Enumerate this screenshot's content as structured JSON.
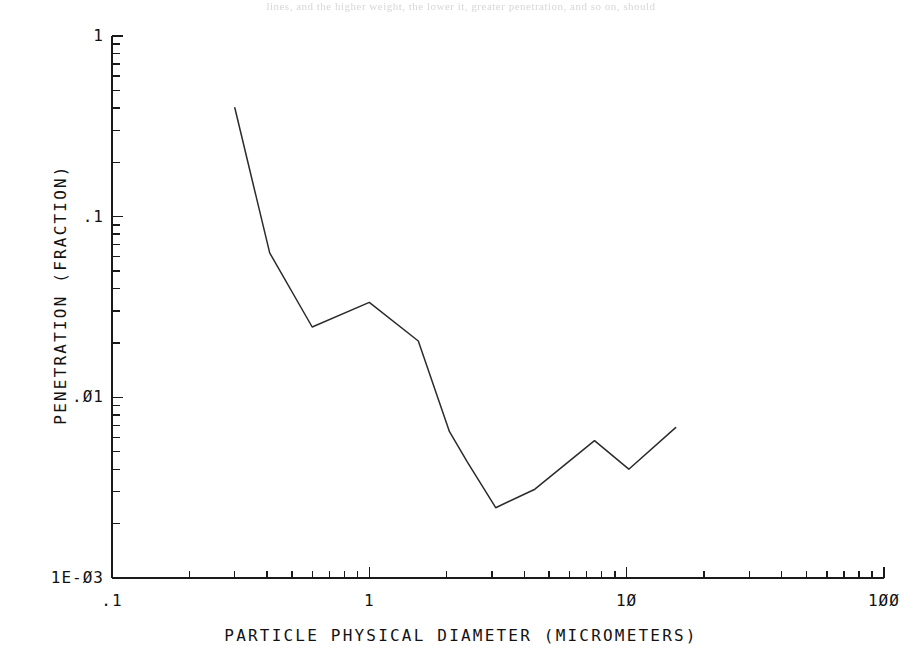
{
  "page": {
    "scan_fragment": "lines, and the higher weight, the lower it, greater penetration, and so on, should"
  },
  "chart_data": {
    "type": "line",
    "title": "",
    "xlabel": "PARTICLE PHYSICAL DIAMETER (MICROMETERS)",
    "ylabel": "PENETRATION (FRACTION)",
    "xscale": "log",
    "yscale": "log",
    "xlim": [
      0.1,
      100
    ],
    "ylim": [
      0.001,
      1
    ],
    "grid": false,
    "legend": null,
    "x_tick_labels": [
      ".1",
      "1",
      "1Ø",
      "1ØØ"
    ],
    "x_tick_values": [
      0.1,
      1,
      10,
      100
    ],
    "y_tick_labels": [
      "1",
      ".1",
      ".Ø1",
      "1E-Ø3"
    ],
    "y_tick_values": [
      1,
      0.1,
      0.01,
      0.001
    ],
    "minor_ticks": [
      2,
      3,
      4,
      5,
      6,
      7,
      8,
      9
    ],
    "series": [
      {
        "name": "penetration",
        "x": [
          0.3,
          0.41,
          0.6,
          1.0,
          1.55,
          2.05,
          2.4,
          3.1,
          4.4,
          7.5,
          10.2,
          15.5
        ],
        "y": [
          0.4,
          0.063,
          0.0245,
          0.0335,
          0.0205,
          0.00645,
          0.0044,
          0.00245,
          0.0031,
          0.00575,
          0.004,
          0.0068
        ]
      }
    ]
  },
  "geometry": {
    "plot_left": 112,
    "plot_right": 884,
    "plot_bottom": 578,
    "plot_top": 36,
    "decade_w": 257.3,
    "decade_h": 180.7
  }
}
